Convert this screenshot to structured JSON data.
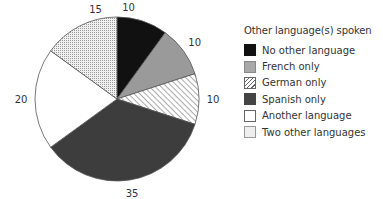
{
  "chart_data": {
    "type": "pie",
    "title": "",
    "legend_title": "Other language(s) spoken",
    "legend_position": "right",
    "start_angle": "12 o'clock",
    "direction": "clockwise",
    "categories": [
      "No other language",
      "French only",
      "German only",
      "Spanish only",
      "Another language",
      "Two other languages"
    ],
    "values": [
      10,
      10,
      10,
      35,
      20,
      15
    ],
    "labels": [
      "10",
      "10",
      "10",
      "35",
      "20",
      "15"
    ],
    "fills": [
      "solid-black",
      "solid-gray",
      "diagonal-hatch",
      "solid-dark-gray",
      "white",
      "dotted"
    ],
    "colors": [
      "#111111",
      "#9a9a9a",
      "#ffffff",
      "#3d3d3d",
      "#ffffff",
      "#d8d8d8"
    ]
  },
  "legend": {
    "title": "Other language(s) spoken",
    "items": [
      {
        "label": "No other language"
      },
      {
        "label": "French only"
      },
      {
        "label": "German only"
      },
      {
        "label": "Spanish only"
      },
      {
        "label": "Another language"
      },
      {
        "label": "Two other languages"
      }
    ]
  }
}
